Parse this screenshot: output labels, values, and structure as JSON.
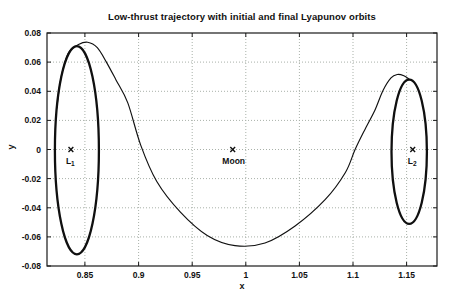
{
  "figure": {
    "background": "#ffffff",
    "colors": {
      "frame": "#1a1a1a",
      "grid": "#a9b1a9",
      "curve": "#101010",
      "text": "#111111"
    }
  },
  "chart_data": {
    "type": "line",
    "title": "Low-thrust trajectory with initial and final Lyapunov orbits",
    "xlabel": "x",
    "ylabel": "y",
    "xlim": [
      0.8146,
      1.1784
    ],
    "ylim": [
      -0.08,
      0.08
    ],
    "grid": true,
    "grid_style": "dotted",
    "legend": "none",
    "xticks": [
      0.85,
      0.9,
      0.95,
      1.0,
      1.05,
      1.1,
      1.15
    ],
    "xtick_labels": [
      "0.85",
      "0.9",
      "0.95",
      "1",
      "1.05",
      "1.1",
      "1.15"
    ],
    "yticks": [
      -0.08,
      -0.06,
      -0.04,
      -0.02,
      0.0,
      0.02,
      0.04,
      0.06,
      0.08
    ],
    "ytick_labels": [
      "-0.08",
      "-0.06",
      "-0.04",
      "-0.02",
      "0",
      "0.02",
      "0.04",
      "0.06",
      "0.08"
    ],
    "points_of_interest": [
      {
        "id": "L1",
        "x": 0.8369,
        "y": 0,
        "marker": "x",
        "label_main": "L",
        "label_sub": "1"
      },
      {
        "id": "Moon",
        "x": 0.98785,
        "y": 0,
        "marker": "x",
        "label_main": "Moon",
        "label_sub": ""
      },
      {
        "id": "L2",
        "x": 1.1557,
        "y": 0,
        "marker": "x",
        "label_main": "L",
        "label_sub": "2"
      }
    ],
    "series": [
      {
        "name": "L1 Lyapunov orbit",
        "type": "ellipse",
        "stroke_width": 2.3,
        "cx": 0.8425,
        "cy": -0.0005,
        "rx": 0.0205,
        "ry": 0.0715
      },
      {
        "name": "L2 Lyapunov orbit",
        "type": "ellipse",
        "stroke_width": 2.3,
        "cx": 1.1525,
        "cy": -0.0015,
        "rx": 0.0165,
        "ry": 0.0495
      },
      {
        "name": "Low-thrust transfer trajectory",
        "type": "path",
        "stroke_width": 1.15,
        "points": [
          [
            0.8237,
            0.0285
          ],
          [
            0.8268,
            0.046
          ],
          [
            0.8309,
            0.059
          ],
          [
            0.8357,
            0.0675
          ],
          [
            0.844,
            0.0722
          ],
          [
            0.8525,
            0.0737
          ],
          [
            0.8615,
            0.07
          ],
          [
            0.87,
            0.06
          ],
          [
            0.879,
            0.0478
          ],
          [
            0.89,
            0.032
          ],
          [
            0.902,
            0.003
          ],
          [
            0.917,
            -0.022
          ],
          [
            0.939,
            -0.043
          ],
          [
            0.964,
            -0.059
          ],
          [
            0.99,
            -0.066
          ],
          [
            1.018,
            -0.0642
          ],
          [
            1.046,
            -0.0525
          ],
          [
            1.074,
            -0.0345
          ],
          [
            1.093,
            -0.0158
          ],
          [
            1.102,
            0.0
          ],
          [
            1.112,
            0.015
          ],
          [
            1.1205,
            0.027
          ],
          [
            1.128,
            0.0405
          ],
          [
            1.1355,
            0.0492
          ],
          [
            1.1415,
            0.0515
          ],
          [
            1.1475,
            0.0506
          ],
          [
            1.1525,
            0.0482
          ]
        ]
      }
    ]
  }
}
